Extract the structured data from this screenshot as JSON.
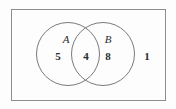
{
  "figure": {
    "type": "venn-diagram",
    "colors": {
      "background": "#fdfdfd",
      "rectangle_stroke": "#8d8d8d",
      "circle_stroke": "#7a7a7a",
      "text": "#2b2b2b"
    }
  },
  "sets": {
    "a": {
      "label": "A",
      "only_count": "5"
    },
    "b": {
      "label": "B",
      "only_count": "8"
    },
    "intersection": {
      "count": "4"
    },
    "outside": {
      "count": "1"
    }
  }
}
